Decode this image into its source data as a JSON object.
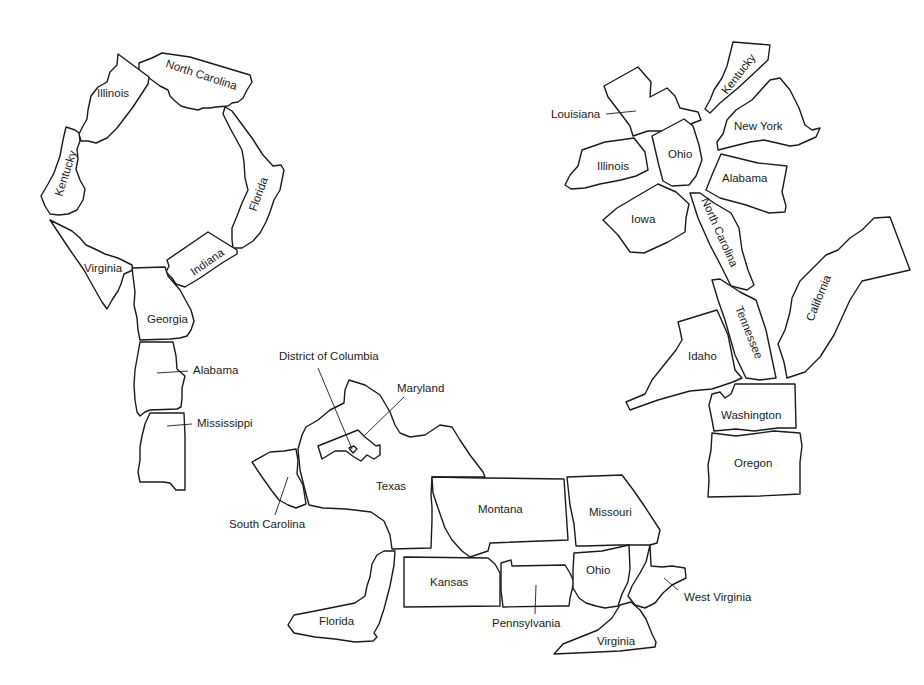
{
  "figure": {
    "type": "puzzle-figures-from-state-outlines",
    "line_color": "#1a1a1a",
    "background": "#ffffff"
  },
  "groups": [
    {
      "name": "ring-figure",
      "states": {
        "north_carolina": "North Carolina",
        "illinois": "Illinois",
        "kentucky": "Kentucky",
        "florida": "Florida",
        "virginia": "Virginia",
        "indiana": "Indiana",
        "georgia": "Georgia",
        "alabama": "Alabama",
        "mississippi": "Mississippi"
      }
    },
    {
      "name": "animal-figure",
      "states": {
        "district_of_columbia": "District of Columbia",
        "maryland": "Maryland",
        "texas": "Texas",
        "south_carolina": "South Carolina",
        "montana": "Montana",
        "missouri": "Missouri",
        "kansas": "Kansas",
        "pennsylvania": "Pennsylvania",
        "ohio": "Ohio",
        "west_virginia": "West Virginia",
        "florida": "Florida",
        "virginia": "Virginia"
      }
    },
    {
      "name": "flower-figure",
      "states": {
        "louisiana": "Louisiana",
        "kentucky": "Kentucky",
        "new_york": "New York",
        "illinois": "Illinois",
        "ohio": "Ohio",
        "alabama": "Alabama",
        "iowa": "Iowa",
        "north_carolina": "North Carolina",
        "tennessee": "Tennessee",
        "california": "California",
        "idaho": "Idaho",
        "washington": "Washington",
        "oregon": "Oregon"
      }
    }
  ]
}
